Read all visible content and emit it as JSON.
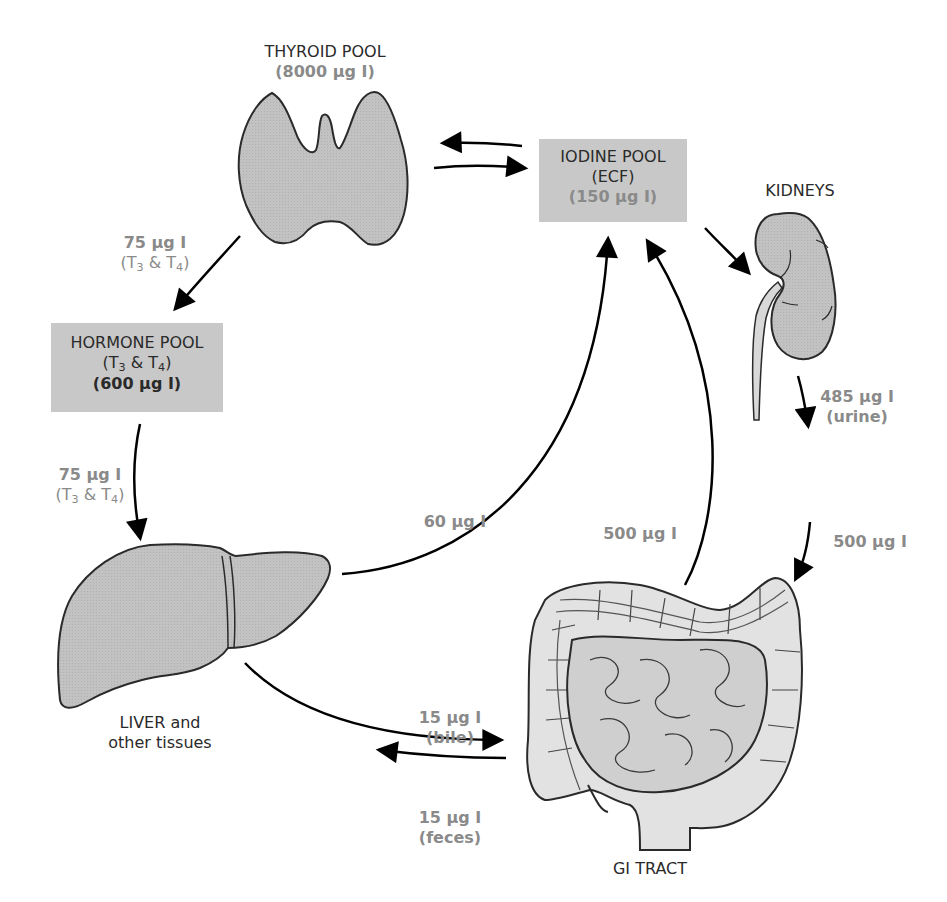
{
  "diagram": {
    "colors": {
      "box_fill": "#c8c8c8",
      "organ_fill": "#bdbdbd",
      "gi_fill": "#e2e2e2",
      "label_dark": "#2a2a2a",
      "label_grey": "#8a8a8a",
      "arrow": "#000000"
    },
    "nodes": {
      "thyroid": {
        "title": "THYROID POOL",
        "amount": "(8000 µg I)"
      },
      "iodine_pool": {
        "title": "IODINE POOL",
        "subtitle": "(ECF)",
        "amount": "(150 µg I)"
      },
      "kidneys": {
        "title": "KIDNEYS"
      },
      "hormone_pool": {
        "title": "HORMONE POOL",
        "sub_prefix": "(T",
        "sub3": "3",
        "sub_mid": " & T",
        "sub4": "4",
        "sub_suffix": ")",
        "amount": "(600 µg I)"
      },
      "liver": {
        "title_line1": "LIVER and",
        "title_line2": "other tissues"
      },
      "gi_tract": {
        "title": "GI TRACT"
      }
    },
    "flows": {
      "thyroid_to_hormone": {
        "amount": "75 µg I",
        "sub_prefix": "(T",
        "sub3": "3",
        "sub_mid": " & T",
        "sub4": "4",
        "sub_suffix": ")"
      },
      "hormone_to_liver": {
        "amount": "75 µg I",
        "sub_prefix": "(T",
        "sub3": "3",
        "sub_mid": " & T",
        "sub4": "4",
        "sub_suffix": ")"
      },
      "liver_to_iodine": {
        "amount": "60 µg I"
      },
      "gi_to_iodine": {
        "amount": "500 µg I"
      },
      "kidney_to_urine": {
        "amount": "485 µg I",
        "note": "(urine)"
      },
      "diet_to_gi": {
        "amount": "500 µg I"
      },
      "liver_to_gi_bile": {
        "amount": "15 µg I",
        "note": "(bile)"
      },
      "gi_to_feces": {
        "amount": "15 µg I",
        "note": "(feces)"
      }
    }
  }
}
